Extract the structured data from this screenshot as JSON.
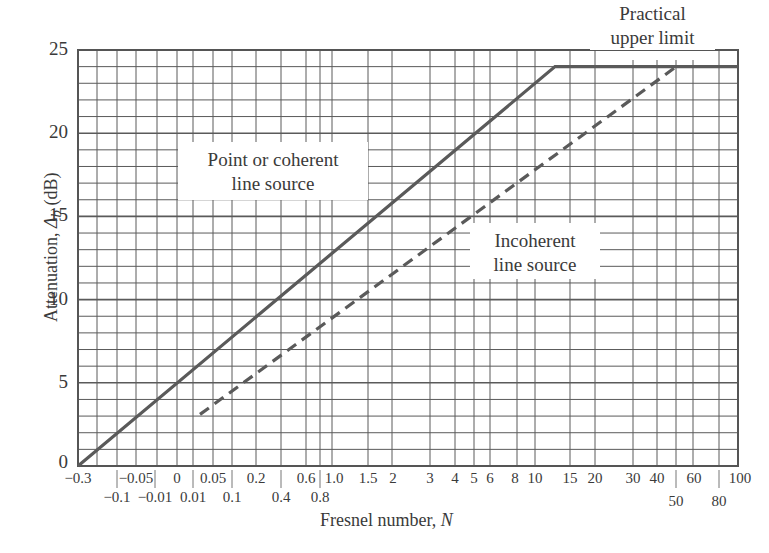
{
  "chart_data": {
    "type": "line",
    "title": "",
    "xlabel": "Fresnel number, N",
    "ylabel": "Attenuation, Δb (dB)",
    "ylim": [
      0,
      25
    ],
    "yticks": [
      0,
      5,
      10,
      15,
      20,
      25
    ],
    "x_scale": "nonlinear (Fresnel number, approx. log-like)",
    "x_ticks_top_row": [
      "-0.3",
      "-0.05",
      "0",
      "0.05",
      "0.2",
      "0.6",
      "1.0",
      "1.5",
      "2",
      "3",
      "4",
      "5",
      "6",
      "8",
      "10",
      "15",
      "20",
      "30",
      "40",
      "60",
      "100"
    ],
    "x_ticks_bottom_row": [
      "-0.1",
      "-0.01",
      "0.01",
      "0.1",
      "0.4",
      "0.8",
      "50",
      "80"
    ],
    "grid": true,
    "series": [
      {
        "name": "Point or coherent line source",
        "style": "solid",
        "points": [
          {
            "N": -0.3,
            "dB": 0
          },
          {
            "N": 0,
            "dB": 5
          },
          {
            "N": 0.4,
            "dB": 10
          },
          {
            "N": 1.5,
            "dB": 15
          },
          {
            "N": 5,
            "dB": 20
          },
          {
            "N": 12.5,
            "dB": 24
          },
          {
            "N": 100,
            "dB": 24
          }
        ]
      },
      {
        "name": "Incoherent line source",
        "style": "dashed",
        "points": [
          {
            "N": 0.01,
            "dB": 3
          },
          {
            "N": 0.2,
            "dB": 5
          },
          {
            "N": 1.5,
            "dB": 10
          },
          {
            "N": 8,
            "dB": 15
          },
          {
            "N": 20,
            "dB": 19
          },
          {
            "N": 50,
            "dB": 24
          }
        ]
      }
    ],
    "annotations": [
      {
        "text": "Practical upper limit",
        "at": "top right, above 24 dB plateau"
      },
      {
        "text": "Point or coherent line source"
      },
      {
        "text": "Incoherent line source"
      }
    ],
    "colors": {
      "line": "#555555",
      "grid": "#555555",
      "text": "#3a3a3a"
    }
  },
  "labels": {
    "ylabel_main": "Attenuation, ",
    "ylabel_symbol": "Δ",
    "ylabel_sub": "b",
    "ylabel_unit": " (dB)",
    "xlabel_main": "Fresnel number, ",
    "xlabel_var": "N",
    "annot_upper_1": "Practical",
    "annot_upper_2": "upper limit",
    "annot_point_1": "Point or coherent",
    "annot_point_2": "line source",
    "annot_incoh_1": "Incoherent",
    "annot_incoh_2": "line source"
  },
  "yticks": [
    "25",
    "20",
    "15",
    "10",
    "5",
    "0"
  ],
  "xticks_top": [
    {
      "label": "−0.3",
      "x": 78
    },
    {
      "label": "−0.05",
      "x": 136
    },
    {
      "label": "0",
      "x": 177
    },
    {
      "label": "0.05",
      "x": 213
    },
    {
      "label": "0.2",
      "x": 256
    },
    {
      "label": "0.6",
      "x": 306
    },
    {
      "label": "1.0",
      "x": 334
    },
    {
      "label": "1.5",
      "x": 368
    },
    {
      "label": "2",
      "x": 393
    },
    {
      "label": "3",
      "x": 430
    },
    {
      "label": "4",
      "x": 455
    },
    {
      "label": "5",
      "x": 474
    },
    {
      "label": "6",
      "x": 490
    },
    {
      "label": "8",
      "x": 515
    },
    {
      "label": "10",
      "x": 535
    },
    {
      "label": "15",
      "x": 570
    },
    {
      "label": "20",
      "x": 595
    },
    {
      "label": "30",
      "x": 633
    },
    {
      "label": "40",
      "x": 657
    },
    {
      "label": "60",
      "x": 694
    },
    {
      "label": "100",
      "x": 740
    }
  ],
  "xticks_bottom": [
    {
      "label": "−0.1",
      "x": 117
    },
    {
      "label": "−0.01",
      "x": 155
    },
    {
      "label": "0.01",
      "x": 193
    },
    {
      "label": "0.1",
      "x": 232
    },
    {
      "label": "0.4",
      "x": 281
    },
    {
      "label": "0.8",
      "x": 320
    },
    {
      "label": "50",
      "x": 676
    },
    {
      "label": "80",
      "x": 719
    }
  ]
}
